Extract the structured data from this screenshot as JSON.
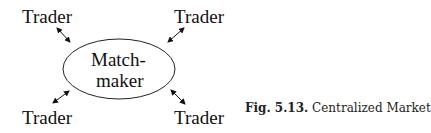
{
  "diagram": {
    "center": {
      "line1": "Match-",
      "line2": "maker"
    },
    "nodes": [
      {
        "id": "top-left",
        "label": "Trader"
      },
      {
        "id": "top-right",
        "label": "Trader"
      },
      {
        "id": "bottom-left",
        "label": "Trader"
      },
      {
        "id": "bottom-right",
        "label": "Trader"
      }
    ],
    "edges": [
      {
        "from": "top-left",
        "to": "center",
        "type": "bidirectional"
      },
      {
        "from": "top-right",
        "to": "center",
        "type": "bidirectional"
      },
      {
        "from": "bottom-left",
        "to": "center",
        "type": "bidirectional"
      },
      {
        "from": "bottom-right",
        "to": "center",
        "type": "bidirectional"
      }
    ]
  },
  "caption": {
    "label": "Fig. 5.13.",
    "text": "Centralized Market"
  }
}
